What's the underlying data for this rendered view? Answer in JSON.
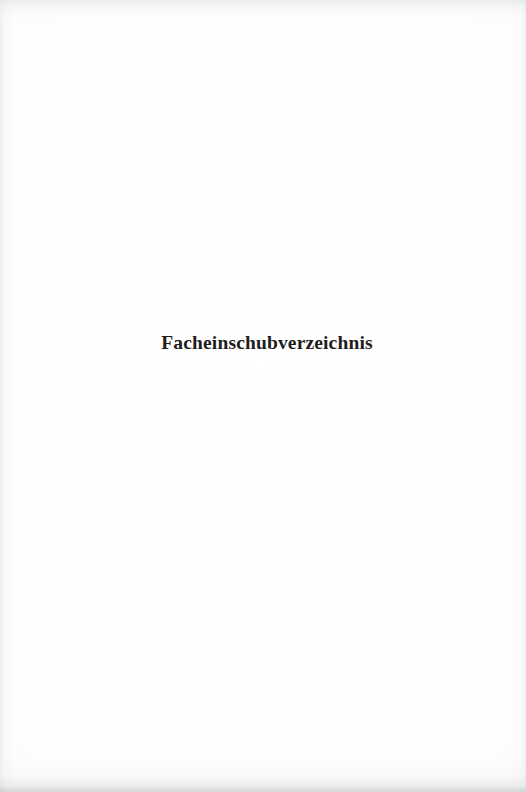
{
  "document": {
    "type": "scanned-book-page",
    "page_kind": "section-divider",
    "language": "de",
    "heading": "Facheinschubverzeichnis",
    "page_number": "",
    "footer": "",
    "header": ""
  },
  "colors": {
    "paper": "#fefefe",
    "ink": "#1f1d1c",
    "edge_shadow": "#b2b4b6"
  },
  "layout": {
    "width_px": 526,
    "height_px": 792,
    "heading_baseline_y_px": 353,
    "heading_left_x_px": 173,
    "heading_right_x_px": 362,
    "alignment": "center"
  }
}
